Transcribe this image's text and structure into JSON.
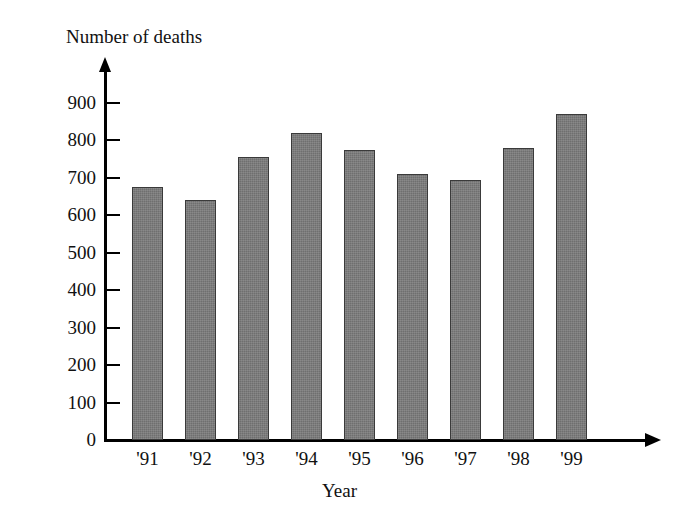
{
  "chart_data": {
    "type": "bar",
    "title": "Number of deaths",
    "xlabel": "Year",
    "ylabel": "Number of deaths",
    "categories": [
      "'91",
      "'92",
      "'93",
      "'94",
      "'95",
      "'96",
      "'97",
      "'98",
      "'99"
    ],
    "values": [
      675,
      640,
      755,
      820,
      775,
      710,
      695,
      780,
      870
    ],
    "ylim": [
      0,
      900
    ],
    "ytick_labels": [
      "900",
      "800",
      "700",
      "600",
      "500",
      "400",
      "300",
      "200",
      "100",
      "0"
    ],
    "ytick_values": [
      900,
      800,
      700,
      600,
      500,
      400,
      300,
      200,
      100,
      0
    ],
    "ytick_step": 100,
    "grid": false,
    "legend": null,
    "bar_color": "#6f6f6f",
    "bar_edge_color": "#3a3a3a",
    "axis_color": "#000000",
    "background_color": "#ffffff"
  }
}
